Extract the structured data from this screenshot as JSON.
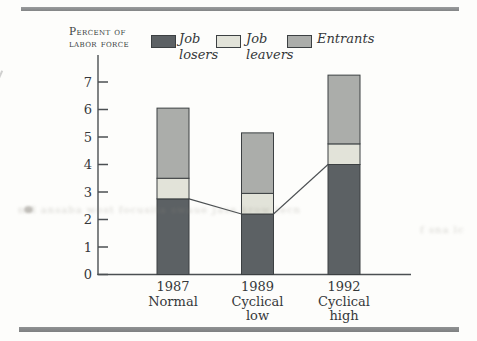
{
  "figure": {
    "axis_title": "Percent of\nlabor force"
  },
  "chart_data": {
    "type": "bar",
    "subtype": "stacked-bar",
    "title": "",
    "ylabel": "Percent of labor force",
    "xlabel": "",
    "categories": [
      "1987\nNormal",
      "1989\nCyclical\nlow",
      "1992\nCyclical\nhigh"
    ],
    "series": [
      {
        "key": "losers",
        "name": "Job\nlosers",
        "values": [
          2.75,
          2.2,
          4.0
        ]
      },
      {
        "key": "leavers",
        "name": "Job\nleavers",
        "values": [
          0.75,
          0.75,
          0.75
        ]
      },
      {
        "key": "entrants",
        "name": "Entrants",
        "values": [
          2.55,
          2.2,
          2.5
        ]
      }
    ],
    "totals": [
      6.05,
      5.15,
      7.25
    ],
    "y_ticks": [
      "0",
      "1",
      "2",
      "3",
      "4",
      "5",
      "6",
      "7"
    ],
    "ylim": [
      0,
      7.5
    ],
    "grid": false,
    "legend_position": "top",
    "annotations": [
      "thin line connects the tops of the Job losers segments between adjacent bars"
    ],
    "colors": {
      "losers": "#5c6164",
      "leavers": "#e2e3d9",
      "entrants": "#abadaa",
      "outline": "#3c4042",
      "axis": "#4b4f52",
      "text": "#35383a"
    }
  },
  "artifacts": {
    "bleed_text_left": "nal ansaba wost focusita swaue Jase krow tecn",
    "bleed_text_right": "f sna lc"
  }
}
